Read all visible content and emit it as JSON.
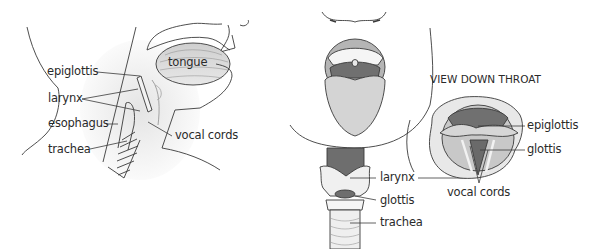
{
  "side_view": {
    "labels": {
      "tongue": "tongue",
      "epiglottis": "epiglottis",
      "larynx": "larynx",
      "esophagus": "esophagus",
      "vocal_cords": "vocal cords",
      "trachea": "trachea"
    }
  },
  "front_view": {
    "labels": {
      "larynx": "larynx",
      "glottis": "glottis",
      "trachea": "trachea"
    }
  },
  "throat_view": {
    "heading": "VIEW DOWN THROAT",
    "labels": {
      "epiglottis": "epiglottis",
      "glottis": "glottis",
      "vocal_cords": "vocal cords"
    }
  },
  "colors": {
    "line": "#3a3a3a",
    "shade_light": "#e6e6e6",
    "shade_mid": "#bdbdbd",
    "shade_dark": "#7a7a7a",
    "text": "#2a2a2a"
  }
}
